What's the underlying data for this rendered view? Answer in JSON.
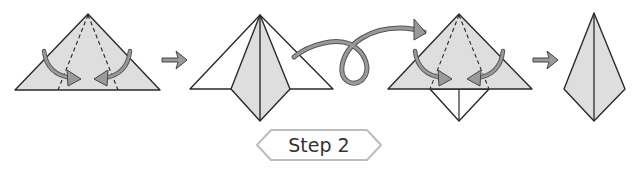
{
  "diagram": {
    "type": "origami-instructions",
    "step_label": "Step 2",
    "colors": {
      "paper_fill": "#dedede",
      "paper_white": "#ffffff",
      "line": "#2a2a2a",
      "arrow_fill": "#9a9a9a",
      "arrow_stroke": "#444444",
      "label_border": "#bdbdbd"
    },
    "figures": [
      {
        "id": "fig-1",
        "description": "Triangle with two dashed valley-fold lines from apex; curved arrows fold sides to center"
      },
      {
        "id": "fig-2",
        "description": "Triangle with sides folded to center forming a kite, diamond extending below base"
      },
      {
        "id": "fig-3",
        "description": "Flipped over: triangle with dashed fold lines and curved arrows, white diamond below"
      },
      {
        "id": "fig-4",
        "description": "Resulting narrow kite shape with center crease"
      }
    ],
    "arrows": [
      {
        "id": "next-arrow-1",
        "kind": "step-arrow"
      },
      {
        "id": "flip-arrow",
        "kind": "turn-over-loop"
      },
      {
        "id": "next-arrow-2",
        "kind": "step-arrow"
      }
    ]
  }
}
